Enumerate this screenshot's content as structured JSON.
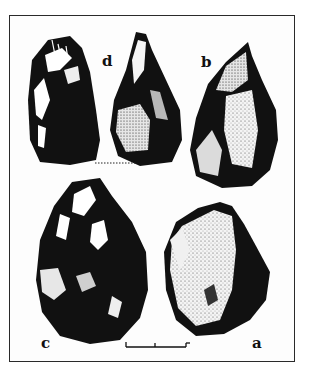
{
  "figure": {
    "labels": {
      "a": "a",
      "b": "b",
      "c": "c",
      "d": "d"
    },
    "colors": {
      "ink": "#111111",
      "paper": "#ffffff",
      "frame": "#2a2a2a"
    },
    "scale_bar": {
      "ticks": 3
    }
  }
}
